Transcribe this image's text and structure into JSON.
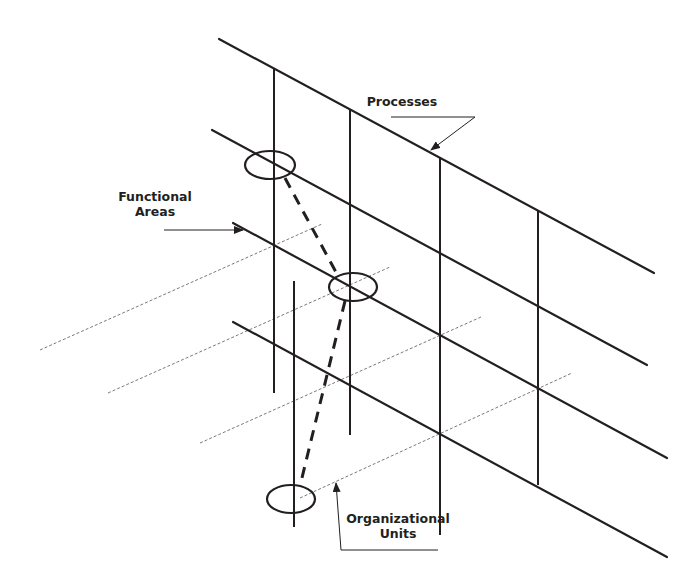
{
  "diagram": {
    "title": "",
    "colors": {
      "line": "#231f20",
      "dotted": "#7a7a7a",
      "background": "#ffffff"
    },
    "labels": {
      "processes": {
        "line1": "Processes"
      },
      "functional_areas": {
        "line1": "Functional",
        "line2": "Areas"
      },
      "organizational_units": {
        "line1": "Organizational",
        "line2": "Units"
      }
    },
    "process_lines": [
      {
        "x1": 219,
        "y1": 39,
        "x2": 654,
        "y2": 273
      },
      {
        "x1": 212,
        "y1": 130,
        "x2": 647,
        "y2": 365
      },
      {
        "x1": 233,
        "y1": 223,
        "x2": 667,
        "y2": 458
      },
      {
        "x1": 233,
        "y1": 322,
        "x2": 667,
        "y2": 557
      }
    ],
    "functional_area_verticals": [
      {
        "x": 274,
        "y1": 69,
        "y2": 393
      },
      {
        "x": 350,
        "y1": 110,
        "y2": 435
      },
      {
        "x": 440,
        "y1": 158,
        "y2": 535
      },
      {
        "x": 538,
        "y1": 210,
        "y2": 485
      },
      {
        "x": 294,
        "y1": 281,
        "y2": 527
      }
    ],
    "organizational_unit_dotted_lines": [
      {
        "x1": 40,
        "y1": 350,
        "x2": 322,
        "y2": 224
      },
      {
        "x1": 108,
        "y1": 393,
        "x2": 390,
        "y2": 267
      },
      {
        "x1": 200,
        "y1": 443,
        "x2": 481,
        "y2": 317
      },
      {
        "x1": 300,
        "y1": 498,
        "x2": 572,
        "y2": 373
      }
    ],
    "highlight_ellipses": [
      {
        "cx": 270,
        "cy": 165,
        "rx": 25,
        "ry": 14
      },
      {
        "cx": 353,
        "cy": 287,
        "rx": 24,
        "ry": 14
      },
      {
        "cx": 291,
        "cy": 499,
        "rx": 24,
        "ry": 14
      }
    ],
    "connector_dashed": [
      {
        "x1": 285,
        "y1": 178,
        "x2": 337,
        "y2": 274
      },
      {
        "x1": 345,
        "y1": 301,
        "x2": 300,
        "y2": 486
      }
    ]
  }
}
